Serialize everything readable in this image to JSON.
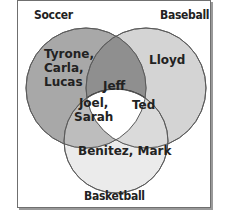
{
  "diagram": {
    "type": "venn",
    "sets": [
      {
        "name": "Soccer",
        "color": "#a9a9a9"
      },
      {
        "name": "Baseball",
        "color": "#cfcfcf"
      },
      {
        "name": "Basketball",
        "color": "#e6e6e6"
      }
    ],
    "regions": {
      "soccer_only": "Tyrone, Carla, Lucas",
      "soccer_only_lines": [
        "Tyrone,",
        "Carla,",
        "Lucas"
      ],
      "baseball_only": "Lloyd",
      "basketball_only": "Benitez, Mark",
      "soccer_basketball": "Joel, Sarah",
      "soccer_basketball_lines": [
        "Joel,",
        "Sarah"
      ],
      "baseball_basketball": "Ted",
      "all_three": "Jeff"
    }
  }
}
